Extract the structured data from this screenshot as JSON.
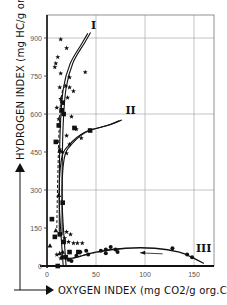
{
  "chart_data": {
    "type": "scatter",
    "title": "",
    "xlabel": "OXYGEN INDEX (mg CO2/g org.C)",
    "ylabel": "HYDROGEN INDEX (mg HC/g org.C)",
    "xlim": [
      0,
      170
    ],
    "ylim": [
      0,
      980
    ],
    "x_ticks": [
      0,
      50,
      100,
      150
    ],
    "y_ticks": [
      0,
      150,
      300,
      450,
      600,
      750,
      900
    ],
    "x_tick_labels": [
      "0",
      "50",
      "100",
      "150"
    ],
    "y_tick_labels": [
      "0",
      "150",
      "300",
      "450",
      "600",
      "750",
      "900"
    ],
    "grid": {
      "x": [
        50,
        100,
        150
      ],
      "y": [
        300,
        600,
        900
      ]
    },
    "legend": null,
    "curve_labels": [
      {
        "text": "I",
        "x": 45,
        "y": 935
      },
      {
        "text": "II",
        "x": 80,
        "y": 600
      },
      {
        "text": "III",
        "x": 152,
        "y": 55
      }
    ],
    "series": [
      {
        "name": "stars",
        "marker": "star",
        "points": [
          [
            14,
            895
          ],
          [
            20,
            860
          ],
          [
            11,
            825
          ],
          [
            9,
            800
          ],
          [
            8,
            785
          ],
          [
            14,
            760
          ],
          [
            39,
            765
          ],
          [
            23,
            745
          ],
          [
            19,
            710
          ],
          [
            23,
            705
          ],
          [
            27,
            690
          ],
          [
            13,
            705
          ],
          [
            21,
            665
          ],
          [
            14,
            660
          ],
          [
            10,
            625
          ],
          [
            12,
            580
          ],
          [
            25,
            590
          ],
          [
            20,
            515
          ],
          [
            30,
            540
          ],
          [
            35,
            505
          ],
          [
            23,
            480
          ],
          [
            13,
            460
          ],
          [
            15,
            450
          ],
          [
            20,
            445
          ],
          [
            20,
            135
          ],
          [
            24,
            125
          ],
          [
            18,
            110
          ],
          [
            22,
            95
          ],
          [
            27,
            90
          ],
          [
            31,
            90
          ],
          [
            36,
            90
          ],
          [
            10,
            45
          ],
          [
            14,
            30
          ]
        ]
      },
      {
        "name": "squares",
        "marker": "square",
        "points": [
          [
            16,
            645
          ],
          [
            15,
            615
          ],
          [
            17,
            600
          ],
          [
            12,
            555
          ],
          [
            9,
            490
          ],
          [
            28,
            545
          ],
          [
            44,
            535
          ],
          [
            5,
            185
          ],
          [
            16,
            250
          ],
          [
            8,
            115
          ],
          [
            13,
            125
          ],
          [
            17,
            95
          ],
          [
            23,
            55
          ],
          [
            19,
            35
          ],
          [
            32,
            55
          ],
          [
            11,
            0
          ]
        ]
      },
      {
        "name": "dots",
        "marker": "circle",
        "points": [
          [
            16,
            35
          ],
          [
            22,
            25
          ],
          [
            25,
            20
          ],
          [
            30,
            40
          ],
          [
            34,
            55
          ],
          [
            40,
            60
          ],
          [
            42,
            45
          ],
          [
            55,
            60
          ],
          [
            60,
            50
          ],
          [
            65,
            75
          ],
          [
            70,
            65
          ],
          [
            72,
            55
          ],
          [
            60,
            65
          ],
          [
            128,
            70
          ],
          [
            143,
            45
          ],
          [
            148,
            35
          ]
        ]
      },
      {
        "name": "triangles",
        "marker": "triangle",
        "points": [
          [
            13,
            455
          ],
          [
            12,
            280
          ],
          [
            9,
            140
          ],
          [
            3,
            80
          ],
          [
            13,
            50
          ],
          [
            16,
            55
          ]
        ]
      }
    ],
    "curves": [
      {
        "name": "I",
        "style": "double",
        "points": [
          [
            14,
            120
          ],
          [
            14,
            350
          ],
          [
            15,
            550
          ],
          [
            18,
            700
          ],
          [
            25,
            800
          ],
          [
            37,
            880
          ],
          [
            43,
            920
          ]
        ]
      },
      {
        "name": "II",
        "style": "double",
        "points": [
          [
            18,
            0
          ],
          [
            14,
            250
          ],
          [
            16,
            420
          ],
          [
            24,
            480
          ],
          [
            40,
            530
          ],
          [
            62,
            555
          ],
          [
            75,
            575
          ]
        ]
      },
      {
        "name": "III",
        "style": "single",
        "points": [
          [
            14,
            40
          ],
          [
            24,
            30
          ],
          [
            50,
            55
          ],
          [
            80,
            70
          ],
          [
            110,
            70
          ],
          [
            135,
            55
          ],
          [
            150,
            30
          ],
          [
            160,
            10
          ]
        ]
      }
    ],
    "dashed_trend": [
      {
        "name": "I-dashed",
        "points": [
          [
            10,
            150
          ],
          [
            11,
            350
          ],
          [
            13,
            600
          ],
          [
            16,
            700
          ]
        ]
      },
      {
        "name": "III-dashed",
        "points": [
          [
            22,
            25
          ],
          [
            40,
            45
          ],
          [
            65,
            65
          ],
          [
            78,
            68
          ]
        ]
      }
    ],
    "arrows": [
      {
        "name": "III-direction",
        "from": [
          118,
          48
        ],
        "to": [
          95,
          52
        ]
      }
    ]
  }
}
